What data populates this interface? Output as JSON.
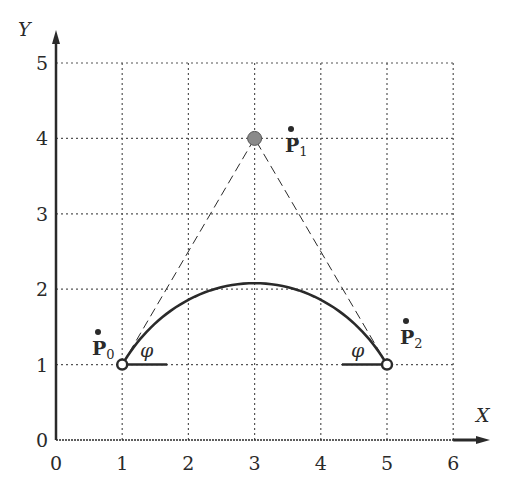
{
  "figure": {
    "axes": {
      "x_label": "X",
      "y_label": "Y",
      "x_ticks": [
        "0",
        "1",
        "2",
        "3",
        "4",
        "5",
        "6"
      ],
      "y_ticks": [
        "0",
        "1",
        "2",
        "3",
        "4",
        "5"
      ],
      "origin_label": "0",
      "grid": "dotted"
    },
    "points": [
      {
        "id": "P0",
        "name": "P",
        "sub": "0",
        "x": 1,
        "y": 1,
        "style": "hollow-circle"
      },
      {
        "id": "P1",
        "name": "P",
        "sub": "1",
        "x": 3,
        "y": 4,
        "style": "filled-grey-circle"
      },
      {
        "id": "P2",
        "name": "P",
        "sub": "2",
        "x": 5,
        "y": 1,
        "style": "hollow-circle"
      }
    ],
    "angles": [
      {
        "at": "P0",
        "label": "φ"
      },
      {
        "at": "P2",
        "label": "φ"
      }
    ],
    "curve": {
      "type": "rational-quadratic-bezier-arc",
      "start": [
        1,
        1
      ],
      "control": [
        3,
        4
      ],
      "end": [
        5,
        1
      ],
      "peak_y": 2.08
    },
    "control_polygon": "dashed",
    "colors": {
      "ink": "#2a2a2a",
      "grid": "#555555",
      "control_fill": "#8a8a8a",
      "background": "#ffffff"
    }
  }
}
